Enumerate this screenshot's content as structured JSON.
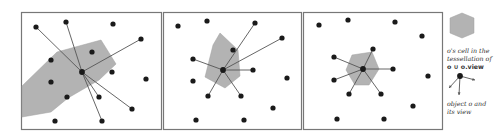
{
  "colors": {
    "cell_fill": "#b3b3b3",
    "point": "#1a1a1a",
    "edge": "#555555",
    "frame": "#777777"
  },
  "panels": [
    {
      "frame": [
        21,
        12,
        140,
        117
      ],
      "center": [
        82,
        72
      ],
      "cell": [
        [
          22,
          86
        ],
        [
          57,
          52
        ],
        [
          101,
          40
        ],
        [
          116,
          64
        ],
        [
          99,
          80
        ],
        [
          68,
          98
        ],
        [
          51,
          112
        ],
        [
          22,
          117
        ]
      ],
      "points": [
        [
          36,
          27
        ],
        [
          66,
          22
        ],
        [
          113,
          24
        ],
        [
          141,
          39
        ],
        [
          92,
          52
        ],
        [
          51,
          60
        ],
        [
          112,
          72
        ],
        [
          146,
          79
        ],
        [
          51,
          82
        ],
        [
          67,
          97
        ],
        [
          99,
          97
        ],
        [
          132,
          109
        ],
        [
          55,
          121
        ],
        [
          102,
          121
        ]
      ],
      "view": [
        [
          36,
          27
        ],
        [
          66,
          22
        ],
        [
          141,
          39
        ],
        [
          99,
          97
        ],
        [
          132,
          109
        ],
        [
          102,
          121
        ]
      ]
    },
    {
      "frame": [
        163,
        12,
        138,
        117
      ],
      "center": [
        223,
        70
      ],
      "cell": [
        [
          220,
          33
        ],
        [
          238,
          50
        ],
        [
          240,
          76
        ],
        [
          225,
          88
        ],
        [
          205,
          77
        ],
        [
          213,
          45
        ]
      ],
      "points": [
        [
          178,
          26
        ],
        [
          207,
          21
        ],
        [
          255,
          23
        ],
        [
          282,
          38
        ],
        [
          233,
          50
        ],
        [
          193,
          59
        ],
        [
          253,
          70
        ],
        [
          287,
          78
        ],
        [
          193,
          81
        ],
        [
          208,
          96
        ],
        [
          241,
          96
        ],
        [
          273,
          108
        ],
        [
          196,
          120
        ],
        [
          244,
          120
        ]
      ],
      "view": [
        [
          255,
          23
        ],
        [
          282,
          38
        ],
        [
          193,
          59
        ],
        [
          253,
          70
        ],
        [
          208,
          96
        ],
        [
          241,
          96
        ]
      ]
    },
    {
      "frame": [
        303,
        12,
        139,
        117
      ],
      "center": [
        363,
        69
      ],
      "cell": [
        [
          352,
          55
        ],
        [
          372,
          52
        ],
        [
          379,
          69
        ],
        [
          369,
          85
        ],
        [
          355,
          85
        ],
        [
          346,
          70
        ]
      ],
      "points": [
        [
          319,
          25
        ],
        [
          348,
          20
        ],
        [
          395,
          22
        ],
        [
          422,
          36
        ],
        [
          373,
          49
        ],
        [
          334,
          57
        ],
        [
          393,
          69
        ],
        [
          428,
          76
        ],
        [
          334,
          80
        ],
        [
          349,
          94
        ],
        [
          381,
          94
        ],
        [
          413,
          106
        ],
        [
          337,
          119
        ],
        [
          384,
          119
        ]
      ],
      "view": [
        [
          373,
          49
        ],
        [
          334,
          57
        ],
        [
          393,
          69
        ],
        [
          334,
          80
        ],
        [
          349,
          94
        ],
        [
          381,
          94
        ]
      ]
    }
  ],
  "legend": {
    "cell_caption_line1": "o's cell in the",
    "cell_caption_line2": "tessellation of",
    "cell_caption_line3": "o ∪ o.view",
    "object_caption_line1": "object o and",
    "object_caption_line2": "its view"
  }
}
